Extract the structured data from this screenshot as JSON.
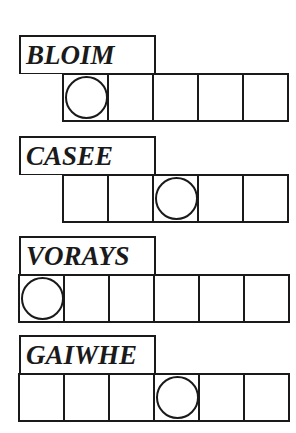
{
  "puzzles": [
    {
      "scrambled": "BLOIM",
      "letter_count": 5,
      "circled_index": 0,
      "cells_start_offset": 1
    },
    {
      "scrambled": "CASEE",
      "letter_count": 5,
      "circled_index": 2,
      "cells_start_offset": 1
    },
    {
      "scrambled": "VORAYS",
      "letter_count": 6,
      "circled_index": 0,
      "cells_start_offset": 0
    },
    {
      "scrambled": "GAIWHE",
      "letter_count": 6,
      "circled_index": 3,
      "cells_start_offset": 0
    }
  ],
  "colors": {
    "ink": "#1a1a1a",
    "paper": "#ffffff"
  }
}
